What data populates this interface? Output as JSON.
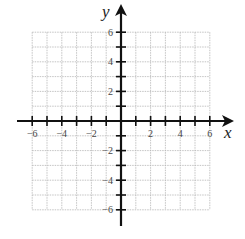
{
  "diagram": {
    "type": "coordinate-plane",
    "x_axis": {
      "label": "x",
      "min": -6,
      "max": 6,
      "tick_step": 1,
      "labels": [
        {
          "value": -6,
          "text": "−6"
        },
        {
          "value": -4,
          "text": "−4"
        },
        {
          "value": -2,
          "text": "−2"
        },
        {
          "value": 2,
          "text": "2"
        },
        {
          "value": 4,
          "text": "4"
        },
        {
          "value": 6,
          "text": "6"
        }
      ]
    },
    "y_axis": {
      "label": "y",
      "min": -6,
      "max": 6,
      "tick_step": 1,
      "labels": [
        {
          "value": 6,
          "text": "6"
        },
        {
          "value": 4,
          "text": "4"
        },
        {
          "value": 2,
          "text": "2"
        },
        {
          "value": -2,
          "text": "−2"
        },
        {
          "value": -4,
          "text": "−4"
        },
        {
          "value": -6,
          "text": "−6"
        }
      ]
    },
    "grid": {
      "visible": true,
      "style": "dashed",
      "color": "#b5b5b5"
    },
    "axis_color": "#111111"
  }
}
